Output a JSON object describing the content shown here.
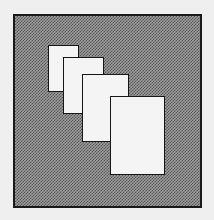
{
  "figure": {
    "frame": {
      "x": 13,
      "y": 14,
      "w": 189,
      "h": 194,
      "fill": "#9a9a9a",
      "border": "#1a1a1a"
    },
    "cards": [
      {
        "x": 48,
        "y": 45,
        "w": 31,
        "h": 47,
        "fill": "#f4f4f4"
      },
      {
        "x": 63,
        "y": 57,
        "w": 41,
        "h": 57,
        "fill": "#f4f4f4"
      },
      {
        "x": 82,
        "y": 74,
        "w": 47,
        "h": 68,
        "fill": "#f4f4f4"
      },
      {
        "x": 110,
        "y": 96,
        "w": 55,
        "h": 79,
        "fill": "#f4f4f4"
      }
    ]
  }
}
